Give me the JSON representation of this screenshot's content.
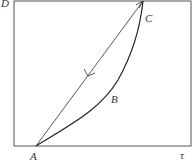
{
  "diagram": {
    "axes": {
      "y_label": "D",
      "x_label": "τ"
    },
    "points": {
      "A": "A",
      "B": "B",
      "C": "C"
    },
    "paths": [
      {
        "name": "straight-path-C-to-A",
        "from": "C",
        "to": "A",
        "direction": "C→A"
      },
      {
        "name": "curved-path-A-to-C-via-B",
        "from": "A",
        "to": "C",
        "via": "B"
      }
    ],
    "colors": {
      "frame": "#555555",
      "line": "#444444",
      "curve": "#222222",
      "background": "#ffffff"
    }
  }
}
